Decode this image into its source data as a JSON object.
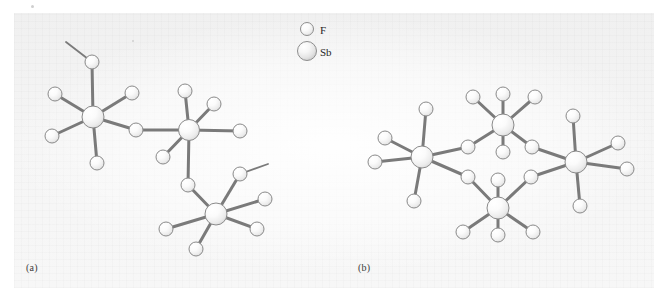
{
  "figure": {
    "type": "molecular-structure-diagram",
    "background_color": "#f4f4f4",
    "page_color": "#ffffff",
    "bond_color": "#7a7a7a",
    "atom_outline_color": "#8a8a8a",
    "atom_fill_color": "#f7f7f7"
  },
  "legend": {
    "items": [
      {
        "symbol": "F",
        "label": "F",
        "radius": 6.5,
        "icon": "small-sphere-icon"
      },
      {
        "symbol": "Sb",
        "label": "Sb",
        "radius": 9.5,
        "icon": "large-sphere-icon"
      }
    ]
  },
  "panels": [
    {
      "id": "a",
      "label": "(a)",
      "description": "open trimeric chain of SbF6 octahedra linked by bridging fluorine"
    },
    {
      "id": "b",
      "label": "(b)",
      "description": "cyclic tetramer of SbF6 octahedra linked by four bridging fluorine"
    }
  ],
  "structure_a": {
    "sb_atoms": [
      {
        "id": "a-sb1",
        "x": 93,
        "y": 117,
        "r": 11
      },
      {
        "id": "a-sb2",
        "x": 189,
        "y": 130,
        "r": 10.5
      },
      {
        "id": "a-sb3",
        "x": 216,
        "y": 214,
        "r": 11
      }
    ],
    "f_atoms": [
      {
        "id": "a-f1",
        "x": 92,
        "y": 62,
        "r": 7
      },
      {
        "id": "a-f2",
        "x": 55,
        "y": 94,
        "r": 7
      },
      {
        "id": "a-f3",
        "x": 132,
        "y": 93,
        "r": 7
      },
      {
        "id": "a-f4",
        "x": 52,
        "y": 136,
        "r": 7
      },
      {
        "id": "a-f5",
        "x": 97,
        "y": 163,
        "r": 7
      },
      {
        "id": "a-f6",
        "x": 136,
        "y": 130,
        "r": 7,
        "bridging": true
      },
      {
        "id": "a-f7",
        "x": 185,
        "y": 91,
        "r": 7
      },
      {
        "id": "a-f8",
        "x": 214,
        "y": 104,
        "r": 7
      },
      {
        "id": "a-f9",
        "x": 240,
        "y": 131,
        "r": 7
      },
      {
        "id": "a-f10",
        "x": 163,
        "y": 157,
        "r": 7
      },
      {
        "id": "a-f11",
        "x": 188,
        "y": 185,
        "r": 7,
        "bridging": true
      },
      {
        "id": "a-f12",
        "x": 240,
        "y": 174,
        "r": 7
      },
      {
        "id": "a-f13",
        "x": 265,
        "y": 199,
        "r": 7
      },
      {
        "id": "a-f14",
        "x": 257,
        "y": 229,
        "r": 7
      },
      {
        "id": "a-f15",
        "x": 196,
        "y": 249,
        "r": 7
      },
      {
        "id": "a-f16",
        "x": 166,
        "y": 229,
        "r": 7
      }
    ],
    "bonds": [
      [
        "a-sb1",
        "a-f1"
      ],
      [
        "a-sb1",
        "a-f2"
      ],
      [
        "a-sb1",
        "a-f3"
      ],
      [
        "a-sb1",
        "a-f4"
      ],
      [
        "a-sb1",
        "a-f5"
      ],
      [
        "a-sb1",
        "a-f6"
      ],
      [
        "a-f6",
        "a-sb2"
      ],
      [
        "a-sb2",
        "a-f7"
      ],
      [
        "a-sb2",
        "a-f8"
      ],
      [
        "a-sb2",
        "a-f9"
      ],
      [
        "a-sb2",
        "a-f10"
      ],
      [
        "a-sb2",
        "a-f11"
      ],
      [
        "a-f11",
        "a-sb3"
      ],
      [
        "a-sb3",
        "a-f12"
      ],
      [
        "a-sb3",
        "a-f13"
      ],
      [
        "a-sb3",
        "a-f14"
      ],
      [
        "a-sb3",
        "a-f15"
      ],
      [
        "a-sb3",
        "a-f16"
      ]
    ],
    "open_bond_stubs": [
      {
        "from": "a-f1",
        "x2": 66,
        "y2": 42
      },
      {
        "from": "a-f12",
        "x2": 268,
        "y2": 164
      }
    ]
  },
  "structure_b": {
    "sb_atoms": [
      {
        "id": "b-sb1",
        "x": 422,
        "y": 157,
        "r": 11
      },
      {
        "id": "b-sb2",
        "x": 503,
        "y": 125,
        "r": 11
      },
      {
        "id": "b-sb3",
        "x": 576,
        "y": 162,
        "r": 11
      },
      {
        "id": "b-sb4",
        "x": 498,
        "y": 208,
        "r": 11
      }
    ],
    "f_atoms": [
      {
        "id": "b-f1",
        "x": 426,
        "y": 109,
        "r": 7
      },
      {
        "id": "b-f2",
        "x": 385,
        "y": 138,
        "r": 7
      },
      {
        "id": "b-f3",
        "x": 375,
        "y": 162,
        "r": 7
      },
      {
        "id": "b-f4",
        "x": 414,
        "y": 201,
        "r": 7
      },
      {
        "id": "b-f5",
        "x": 468,
        "y": 147,
        "r": 7,
        "bridging": true
      },
      {
        "id": "b-f6",
        "x": 468,
        "y": 177,
        "r": 7,
        "bridging": true
      },
      {
        "id": "b-f7",
        "x": 473,
        "y": 97,
        "r": 7
      },
      {
        "id": "b-f8",
        "x": 503,
        "y": 94,
        "r": 7
      },
      {
        "id": "b-f9",
        "x": 535,
        "y": 97,
        "r": 7
      },
      {
        "id": "b-f10",
        "x": 503,
        "y": 152,
        "r": 7
      },
      {
        "id": "b-f11",
        "x": 532,
        "y": 147,
        "r": 7,
        "bridging": true
      },
      {
        "id": "b-f12",
        "x": 531,
        "y": 177,
        "r": 7,
        "bridging": true
      },
      {
        "id": "b-f13",
        "x": 573,
        "y": 116,
        "r": 7
      },
      {
        "id": "b-f14",
        "x": 618,
        "y": 143,
        "r": 7
      },
      {
        "id": "b-f15",
        "x": 627,
        "y": 169,
        "r": 7
      },
      {
        "id": "b-f16",
        "x": 580,
        "y": 206,
        "r": 7
      },
      {
        "id": "b-f17",
        "x": 498,
        "y": 180,
        "r": 7
      },
      {
        "id": "b-f18",
        "x": 463,
        "y": 232,
        "r": 7
      },
      {
        "id": "b-f19",
        "x": 498,
        "y": 235,
        "r": 7
      },
      {
        "id": "b-f20",
        "x": 533,
        "y": 232,
        "r": 7
      }
    ],
    "bonds": [
      [
        "b-sb1",
        "b-f1"
      ],
      [
        "b-sb1",
        "b-f2"
      ],
      [
        "b-sb1",
        "b-f3"
      ],
      [
        "b-sb1",
        "b-f4"
      ],
      [
        "b-sb1",
        "b-f5"
      ],
      [
        "b-sb1",
        "b-f6"
      ],
      [
        "b-f5",
        "b-sb2"
      ],
      [
        "b-f6",
        "b-sb4"
      ],
      [
        "b-sb2",
        "b-f7"
      ],
      [
        "b-sb2",
        "b-f8"
      ],
      [
        "b-sb2",
        "b-f9"
      ],
      [
        "b-sb2",
        "b-f10"
      ],
      [
        "b-sb2",
        "b-f11"
      ],
      [
        "b-f11",
        "b-sb3"
      ],
      [
        "b-sb3",
        "b-f13"
      ],
      [
        "b-sb3",
        "b-f14"
      ],
      [
        "b-sb3",
        "b-f15"
      ],
      [
        "b-sb3",
        "b-f16"
      ],
      [
        "b-sb3",
        "b-f12"
      ],
      [
        "b-f12",
        "b-sb4"
      ],
      [
        "b-sb4",
        "b-f17"
      ],
      [
        "b-sb4",
        "b-f18"
      ],
      [
        "b-sb4",
        "b-f19"
      ],
      [
        "b-sb4",
        "b-f20"
      ]
    ],
    "open_bond_stubs": []
  }
}
